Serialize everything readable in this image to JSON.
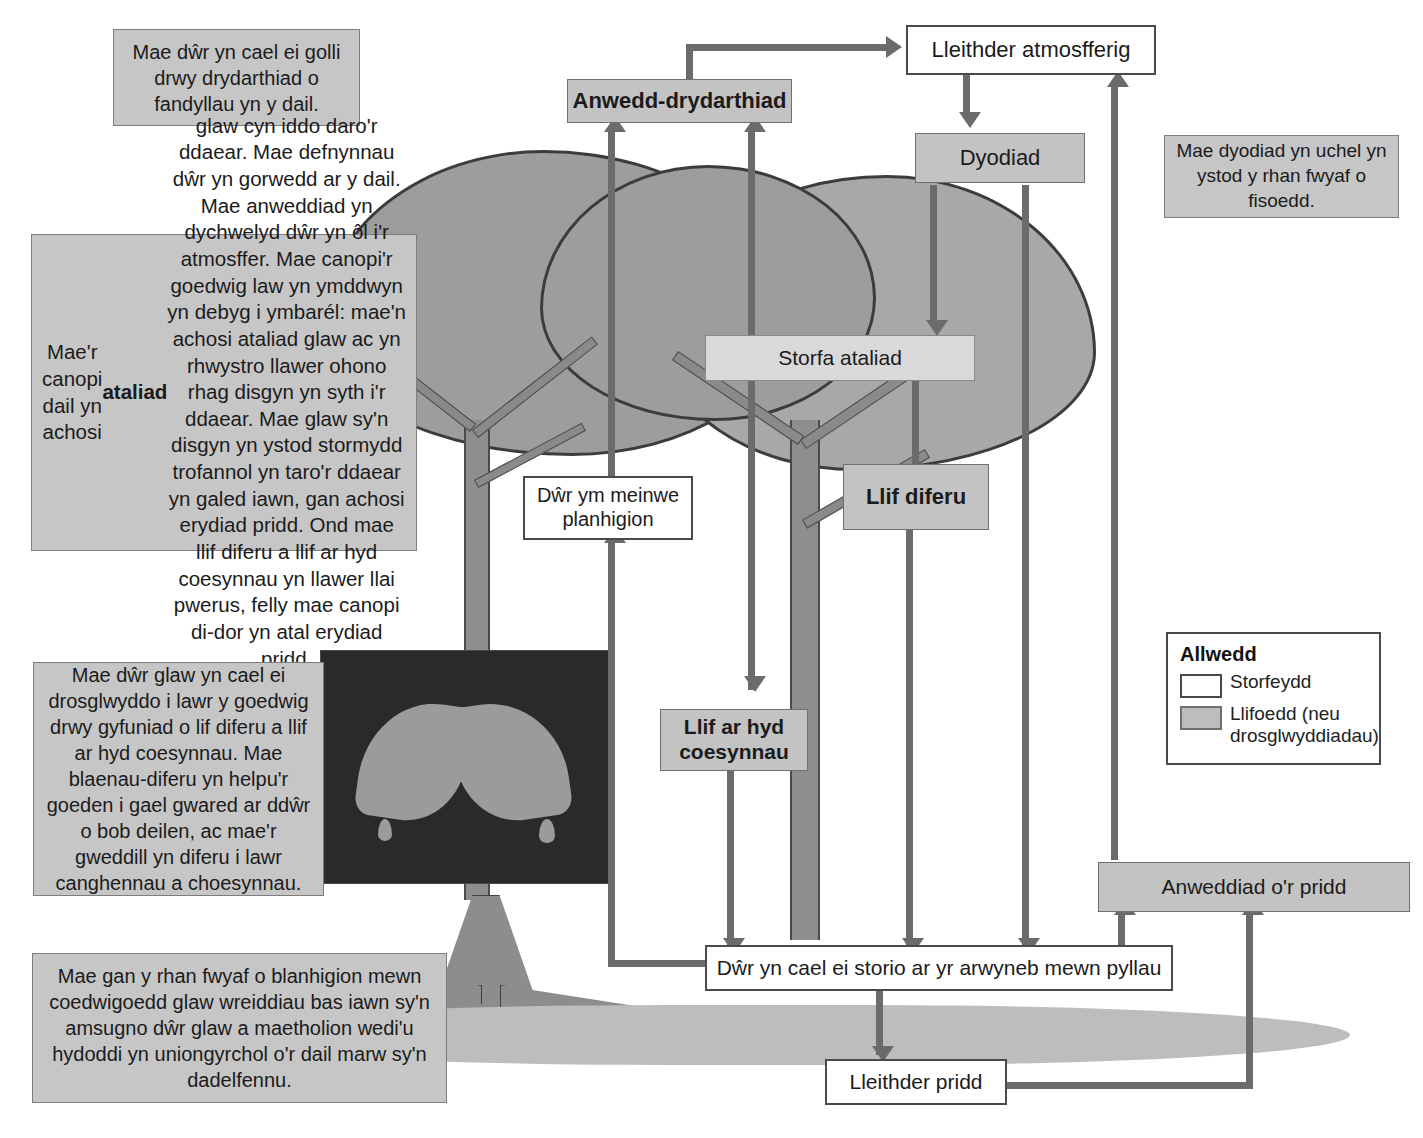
{
  "diagram": {
    "language": "cy"
  },
  "colors": {
    "flow_fill": "#c3c3c3",
    "store_fill": "#ffffff",
    "stroke": "#4a4a4a",
    "arrow": "#6b6b6b",
    "note_fill": "#c6c6c6",
    "canopy": "#9d9d9d",
    "ground": "#bdbdbd"
  },
  "boxes": {
    "anwedd_drydarthiad": "Anwedd-drydarthiad",
    "lleithder_atmosfferig": "Lleithder atmosfferig",
    "dyodiad": "Dyodiad",
    "storfa_ataliad": "Storfa ataliad",
    "dwr_ym_meinwe": "Dŵr ym meinwe\nplanhigion",
    "llif_diferu": "Llif diferu",
    "llif_ar_hyd_coesynnau": "Llif ar hyd\ncoesynnau",
    "anweddiad_or_pridd": "Anweddiad o'r pridd",
    "dwr_yn_cael_ei_storio": "Dŵr yn cael ei storio ar yr arwyneb mewn pyllau",
    "lleithder_pridd": "Lleithder pridd"
  },
  "notes": {
    "transpiration": "Mae dŵr yn cael ei golli drwy drydarthiad o fandyllau yn y dail.",
    "precipitation": "Mae dyodiad yn uchel yn ystod y rhan fwyaf o fisoedd.",
    "canopy": "Mae'r canopi dail yn achosi ataliad glaw cyn iddo daro'r ddaear. Mae defnynnau dŵr yn gorwedd ar y dail. Mae anweddiad yn dychwelyd dŵr yn ôl i'r atmosffer. Mae canopi'r goedwig law yn ymddwyn yn debyg i ymbarél: mae'n achosi ataliad glaw ac yn rhwystro llawer ohono rhag disgyn yn syth i'r ddaear. Mae glaw sy'n disgyn yn ystod stormydd trofannol yn taro'r ddaear yn galed iawn, gan achosi erydiad pridd. Ond mae llif diferu a llif ar hyd coesynnau yn llawer llai pwerus, felly mae canopi di-dor yn atal erydiad pridd.",
    "canopy_bold_word": "ataliad",
    "stemflow": "Mae dŵr glaw yn cael ei drosglwyddo i lawr y goedwig drwy gyfuniad o lif diferu a llif ar hyd coesynnau. Mae blaenau-diferu yn helpu'r goeden i gael gwared ar ddŵr o bob deilen, ac mae'r gweddill yn diferu i lawr canghennau a choesynnau.",
    "roots": "Mae gan y rhan fwyaf o blanhigion mewn coedwigoedd glaw wreiddiau bas iawn sy'n amsugno dŵr glaw a maetholion wedi'u hydoddi yn uniongyrchol o'r dail marw sy'n dadelfennu."
  },
  "legend": {
    "title": "Allwedd",
    "items": [
      {
        "label": "Storfeydd",
        "swatch": "store"
      },
      {
        "label": "Llifoedd (neu\ndrosglwyddiadau)",
        "swatch": "flow"
      }
    ]
  }
}
